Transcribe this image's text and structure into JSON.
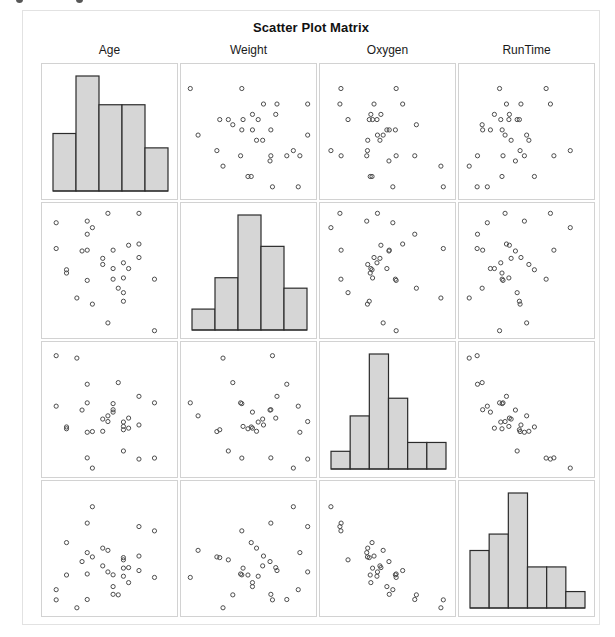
{
  "title": "Scatter Plot Matrix",
  "variables": [
    "Age",
    "Weight",
    "Oxygen",
    "RunTime"
  ],
  "column_headers": [
    "Age",
    "Weight",
    "Oxygen",
    "RunTime"
  ],
  "row_headers": [
    "Age",
    "Weight",
    "Oxygen",
    "RunTime"
  ],
  "colors": {
    "bar_fill": "#d6d6d6",
    "bar_stroke": "#2b2b2b",
    "point_stroke": "#4d4d4d",
    "panel_border": "#d2d2d2",
    "frame_border": "#e2e2e2",
    "text": "#1a1a1a"
  },
  "chart_data": {
    "type": "scatter",
    "title": "Scatter Plot Matrix",
    "xlabel": "",
    "ylabel": "",
    "grid": false,
    "legend": "none",
    "layout": {
      "rows": 4,
      "cols": 4,
      "diagonal": "histogram",
      "offdiagonal": "scatter",
      "n_observations": 31
    },
    "variables": [
      "Age",
      "Weight",
      "Oxygen",
      "RunTime"
    ],
    "axis_ranges": {
      "Age": [
        37,
        60
      ],
      "Weight": [
        59,
        92
      ],
      "Oxygen": [
        37,
        61
      ],
      "RunTime": [
        8.1,
        15
      ]
    },
    "data": {
      "Age": [
        44,
        40,
        44,
        42,
        38,
        47,
        40,
        43,
        44,
        38,
        44,
        45,
        45,
        47,
        54,
        49,
        51,
        51,
        48,
        49,
        57,
        54,
        52,
        50,
        51,
        54,
        51,
        57,
        49,
        48,
        52
      ],
      "Weight": [
        89.47,
        75.07,
        85.84,
        68.15,
        89.02,
        77.45,
        75.98,
        81.19,
        81.42,
        81.87,
        73.03,
        87.66,
        66.45,
        79.15,
        83.12,
        81.42,
        69.63,
        77.91,
        91.63,
        73.37,
        73.37,
        79.38,
        76.32,
        70.87,
        67.25,
        91.63,
        73.71,
        59.08,
        76.32,
        61.24,
        82.78
      ],
      "Oxygen": [
        44.609,
        45.313,
        54.297,
        59.571,
        49.874,
        44.811,
        45.681,
        49.091,
        39.442,
        60.055,
        50.541,
        37.388,
        44.754,
        47.273,
        51.855,
        49.156,
        40.836,
        46.672,
        46.774,
        50.388,
        39.407,
        46.08,
        45.441,
        54.625,
        45.118,
        39.203,
        45.79,
        50.545,
        48.673,
        47.92,
        47.467
      ],
      "RunTime": [
        11.37,
        10.07,
        8.65,
        8.17,
        9.22,
        11.63,
        11.95,
        10.85,
        13.08,
        8.63,
        10.13,
        14.03,
        11.12,
        10.6,
        10.33,
        8.95,
        10.95,
        10,
        10.25,
        10.08,
        12.63,
        11.17,
        9.63,
        8.92,
        11.08,
        12.88,
        10.47,
        9.93,
        9.4,
        11.5,
        10.5
      ]
    },
    "histograms": {
      "Age": {
        "variable": "Age",
        "bins": 5,
        "counts": [
          4,
          8,
          6,
          6,
          3
        ],
        "max_count": 8,
        "bin_edges": [
          37,
          41.6,
          46.2,
          50.8,
          55.4,
          60
        ]
      },
      "Weight": {
        "variable": "Weight",
        "bins": 5,
        "counts": [
          2,
          5,
          11,
          8,
          4
        ],
        "max_count": 11,
        "bin_edges": [
          59,
          65.6,
          72.2,
          78.8,
          85.4,
          92
        ]
      },
      "Oxygen": {
        "variable": "Oxygen",
        "bins": 6,
        "counts": [
          2,
          6,
          13,
          8,
          3,
          3
        ],
        "max_count": 13,
        "bin_edges": [
          37,
          41,
          45,
          49,
          53,
          57,
          61
        ]
      },
      "RunTime": {
        "variable": "RunTime",
        "bins": 6,
        "counts": [
          7,
          9,
          14,
          5,
          5,
          2
        ],
        "max_count": 14,
        "bin_edges": [
          8.1,
          9.25,
          10.4,
          11.55,
          12.7,
          13.85,
          15
        ]
      }
    }
  }
}
